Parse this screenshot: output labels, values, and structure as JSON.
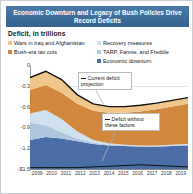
{
  "header": {
    "title": "Economic Downturn and Legacy of Bush Policies Drive Record Deficits"
  },
  "subtitle": "Deficit, in trillions",
  "legend": {
    "items": [
      {
        "label": "Wars in Iraq and Afghanistan",
        "color": "#f0c68a"
      },
      {
        "label": "Bush-era tax cuts",
        "color": "#d2883c"
      },
      {
        "label": "Recovery measures",
        "color": "#cfe0ef"
      },
      {
        "label": "TARP, Fannie, and Freddie",
        "color": "#aec6de"
      },
      {
        "label": "Economic downturn",
        "color": "#4a6ea5"
      }
    ]
  },
  "callouts": {
    "current": "Current deficit projection",
    "without": "Deficit without these factors"
  },
  "chart_data": {
    "type": "area",
    "title": "Economic Downturn and Legacy of Bush Policies Drive Record Deficits",
    "subtitle": "Deficit, in trillions",
    "xlabel": "",
    "ylabel": "Deficit, in trillions",
    "stacked": true,
    "grid": true,
    "legend_position": "top",
    "categories": [
      "2009",
      "2010",
      "2011",
      "2012",
      "2013",
      "2014",
      "2015",
      "2016",
      "2017",
      "2018",
      "2019"
    ],
    "yticks": [
      "-$1.5",
      "-1.2",
      "-0.9",
      "-0.6",
      "-0.3",
      "0"
    ],
    "ytick_values": [
      -1.5,
      -1.2,
      -0.9,
      -0.6,
      -0.3,
      0
    ],
    "ylim": [
      -1.5,
      0
    ],
    "series": [
      {
        "name": "Economic downturn",
        "color": "#4a6ea5",
        "values": [
          -0.42,
          -0.46,
          -0.44,
          -0.4,
          -0.36,
          -0.34,
          -0.33,
          -0.32,
          -0.32,
          -0.33,
          -0.34
        ]
      },
      {
        "name": "TARP, Fannie, and Freddie",
        "color": "#aec6de",
        "values": [
          -0.25,
          -0.17,
          -0.09,
          -0.04,
          -0.02,
          -0.01,
          -0.01,
          -0.01,
          -0.01,
          -0.01,
          -0.01
        ]
      },
      {
        "name": "Recovery measures",
        "color": "#cfe0ef",
        "values": [
          -0.13,
          -0.22,
          -0.19,
          -0.1,
          -0.04,
          -0.02,
          -0.01,
          -0.01,
          -0.01,
          -0.01,
          -0.01
        ]
      },
      {
        "name": "Bush-era tax cuts",
        "color": "#d2883c",
        "values": [
          -0.34,
          -0.36,
          -0.38,
          -0.4,
          -0.42,
          -0.44,
          -0.46,
          -0.49,
          -0.52,
          -0.55,
          -0.58
        ]
      },
      {
        "name": "Wars in Iraq and Afghanistan",
        "color": "#f0c68a",
        "values": [
          -0.18,
          -0.2,
          -0.19,
          -0.13,
          -0.1,
          -0.09,
          -0.09,
          -0.09,
          -0.09,
          -0.09,
          -0.09
        ]
      }
    ],
    "lines": [
      {
        "name": "Current deficit projection",
        "color": "#111111",
        "values": [
          -1.32,
          -1.41,
          -1.29,
          -1.07,
          -0.94,
          -0.9,
          -0.9,
          -0.92,
          -0.95,
          -0.99,
          -1.03
        ]
      },
      {
        "name": "Deficit without these factors",
        "color": "#111111",
        "values": [
          -0.02,
          -0.02,
          -0.02,
          -0.02,
          -0.03,
          -0.04,
          -0.05,
          -0.06,
          -0.05,
          -0.04,
          -0.03
        ]
      }
    ]
  }
}
